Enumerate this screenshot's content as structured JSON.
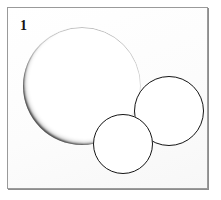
{
  "figure": {
    "label": "1",
    "caption_present": false,
    "medium": "stippled pen-and-ink line drawing",
    "background_color": "#ffffff",
    "ink_color": "#141414",
    "frame": {
      "border_color": "#9a9a9a",
      "shadow_color": "#8d8d8d",
      "fill_color": "#fdfdfd",
      "x": 7,
      "y": 7,
      "width": 201,
      "height": 182
    }
  },
  "spheres": [
    {
      "name": "large-sphere",
      "order": "back",
      "cx": 81,
      "cy": 85,
      "r": 59,
      "shading": "heavy",
      "light_direction": "upper-right"
    },
    {
      "name": "medium-sphere",
      "order": "middle",
      "cx": 168,
      "cy": 110,
      "r": 35,
      "shading": "light",
      "light_direction": "upper-right"
    },
    {
      "name": "small-sphere",
      "order": "front",
      "cx": 122,
      "cy": 143,
      "r": 30,
      "shading": "light",
      "light_direction": "upper-right"
    }
  ]
}
